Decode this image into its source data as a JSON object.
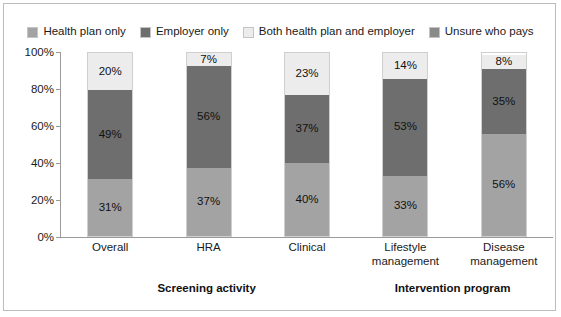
{
  "chart_data": {
    "type": "bar",
    "subtype": "stacked-bar-100",
    "title": "",
    "xlabel": "",
    "ylabel": "",
    "ylim": [
      0,
      100
    ],
    "ytick_labels": [
      "100%",
      "80%",
      "60%",
      "40%",
      "20%",
      "0%"
    ],
    "ytick_values": [
      100,
      80,
      60,
      40,
      20,
      0
    ],
    "grid": false,
    "legend_position": "top-center",
    "categories": [
      "Overall",
      "HRA",
      "Clinical",
      "Lifestyle management",
      "Disease management"
    ],
    "category_lines": [
      [
        "Overall"
      ],
      [
        "HRA"
      ],
      [
        "Clinical"
      ],
      [
        "Lifestyle",
        "management"
      ],
      [
        "Disease",
        "management"
      ]
    ],
    "series": [
      {
        "name": "Health plan only",
        "color": "#a3a3a3",
        "values": [
          31,
          37,
          40,
          33,
          56
        ],
        "labels": [
          "31%",
          "37%",
          "40%",
          "33%",
          "56%"
        ]
      },
      {
        "name": "Employer only",
        "color": "#6e6e6e",
        "values": [
          49,
          56,
          37,
          53,
          35
        ],
        "labels": [
          "49%",
          "56%",
          "37%",
          "53%",
          "35%"
        ]
      },
      {
        "name": "Both health plan and employer",
        "color": "#ececec",
        "values": [
          20,
          7,
          23,
          14,
          8
        ],
        "labels": [
          "20%",
          "7%",
          "23%",
          "14%",
          "8%"
        ]
      },
      {
        "name": "Unsure who pays",
        "color": "#8a8a8a",
        "values": [
          0,
          0,
          0,
          0,
          0
        ],
        "labels": [
          "",
          "",
          "",
          "",
          ""
        ]
      }
    ],
    "group_labels": [
      {
        "label": "Screening activity",
        "categories": [
          "Overall",
          "HRA",
          "Clinical"
        ]
      },
      {
        "label": "Intervention program",
        "categories": [
          "Lifestyle management",
          "Disease management"
        ]
      }
    ],
    "annotations": []
  },
  "legend": {
    "items": [
      {
        "label": "Health plan only",
        "color": "#a3a3a3"
      },
      {
        "label": "Employer only",
        "color": "#6e6e6e"
      },
      {
        "label": "Both health plan and employer",
        "color": "#ececec"
      },
      {
        "label": "Unsure who pays",
        "color": "#8a8a8a"
      }
    ]
  },
  "axis": {
    "y_ticks": [
      {
        "label": "100%",
        "value": 100
      },
      {
        "label": "80%",
        "value": 80
      },
      {
        "label": "60%",
        "value": 60
      },
      {
        "label": "40%",
        "value": 40
      },
      {
        "label": "20%",
        "value": 20
      },
      {
        "label": "0%",
        "value": 0
      }
    ]
  },
  "colors": {
    "series_health_plan_only": "#a3a3a3",
    "series_employer_only": "#6e6e6e",
    "series_both": "#ececec",
    "series_unsure": "#8a8a8a",
    "axis": "#9a9a9a",
    "frame": "#bdbdbd",
    "text": "#1a1a1a",
    "background": "#ffffff"
  }
}
